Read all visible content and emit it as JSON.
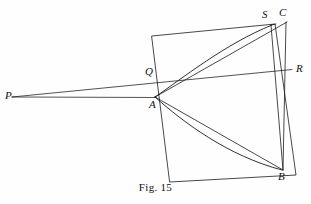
{
  "figure": {
    "caption": "Fig. 15",
    "background_color": "#fefefe",
    "ink_color": "#1a1a1a",
    "width": 311,
    "height": 204,
    "labels": {
      "P": "P",
      "Q": "Q",
      "A": "A",
      "S": "S",
      "C": "C",
      "R": "R",
      "B": "B"
    },
    "points": {
      "P": {
        "x": 12,
        "y": 97
      },
      "Q": {
        "x": 152,
        "y": 75
      },
      "A": {
        "x": 155,
        "y": 97
      },
      "S": {
        "x": 272,
        "y": 25
      },
      "C": {
        "x": 288,
        "y": 22
      },
      "R": {
        "x": 292,
        "y": 70
      },
      "B": {
        "x": 283,
        "y": 170
      }
    },
    "square_corners": {
      "top_left": {
        "x": 152,
        "y": 36
      },
      "top_right": {
        "x": 275,
        "y": 24
      },
      "bottom_right": {
        "x": 296,
        "y": 175
      },
      "bottom_left": {
        "x": 170,
        "y": 182
      }
    },
    "elements": [
      "square-outline",
      "ray-P-to-R",
      "ray-P-to-A",
      "curve-A-to-S",
      "curve-A-to-B",
      "segment-A-to-C",
      "segment-S-to-B",
      "segment-C-to-B",
      "segment-A-to-B-chord",
      "segment-A-to-S-chord"
    ]
  }
}
